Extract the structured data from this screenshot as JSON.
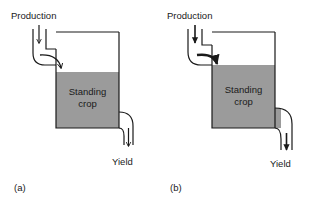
{
  "figure": {
    "type": "flow-diagram",
    "background_color": "#ffffff",
    "line_color": "#1a1a1a",
    "tank_fill_color": "#9b9b9b",
    "text_color": "#1a1a1a"
  },
  "panels": [
    {
      "id": "a",
      "panel_label": "(a)",
      "inflow_label": "Production",
      "tank_label_line1": "Standing",
      "tank_label_line2": "crop",
      "outflow_label": "Yield",
      "pipe_style": "thin",
      "arrow_style": "line",
      "standing_crop_level": "low"
    },
    {
      "id": "b",
      "panel_label": "(b)",
      "inflow_label": "Production",
      "tank_label_line1": "Standing",
      "tank_label_line2": "crop",
      "outflow_label": "Yield",
      "pipe_style": "thick",
      "arrow_style": "solid",
      "standing_crop_level": "high"
    }
  ]
}
